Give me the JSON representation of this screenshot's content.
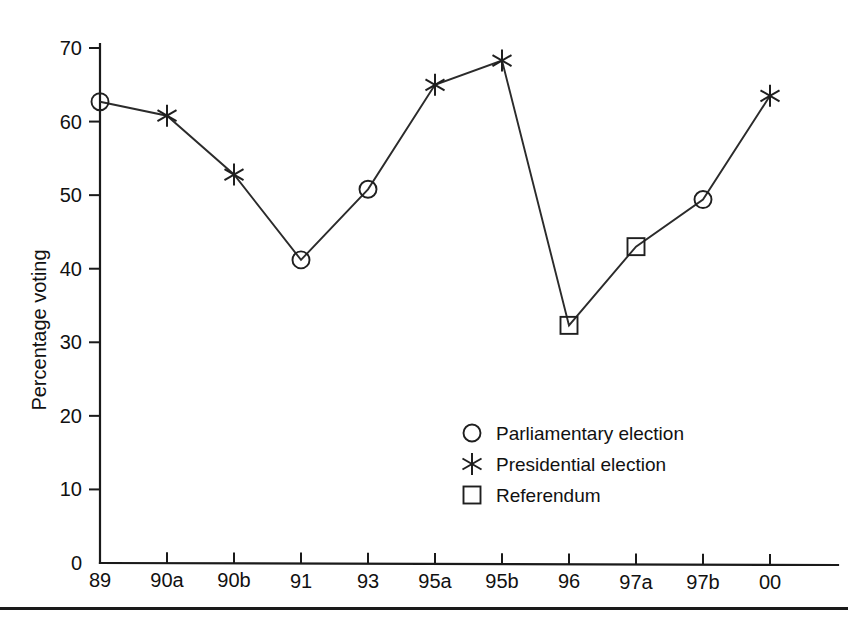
{
  "chart_data": {
    "type": "line",
    "title": "",
    "subtitle": "",
    "xlabel": "",
    "ylabel": "Percentage voting",
    "categories": [
      "89",
      "90a",
      "90b",
      "91",
      "93",
      "95a",
      "95b",
      "96",
      "97a",
      "97b",
      "00"
    ],
    "values": [
      62.7,
      60.8,
      52.8,
      41.2,
      50.8,
      65.0,
      68.3,
      32.3,
      43.0,
      49.4,
      63.5
    ],
    "marker_types": [
      "circle",
      "star",
      "star",
      "circle",
      "circle",
      "star",
      "star",
      "square",
      "square",
      "circle",
      "star"
    ],
    "series": [
      {
        "name": "Percentage voting",
        "values": [
          62.7,
          60.8,
          52.8,
          41.2,
          50.8,
          65.0,
          68.3,
          32.3,
          43.0,
          49.4,
          63.5
        ]
      }
    ],
    "ylim": [
      0,
      70
    ],
    "yticks": [
      0,
      10,
      20,
      30,
      40,
      50,
      60,
      70
    ],
    "ytick_labels": [
      "0",
      "10",
      "20",
      "30",
      "40",
      "50",
      "60",
      "70"
    ],
    "xtick_labels": [
      "89",
      "90a",
      "90b",
      "91",
      "93",
      "95a",
      "95b",
      "96",
      "97a",
      "97b",
      "00"
    ],
    "grid": false,
    "legend_position": "center-right-inside",
    "legend": [
      {
        "marker": "circle",
        "label": "Parliamentary election"
      },
      {
        "marker": "star",
        "label": "Presidential election"
      },
      {
        "marker": "square",
        "label": "Referendum"
      }
    ],
    "colors": {
      "line": "#2b2b2b",
      "marker": "#1f1f1f",
      "axis": "#1a1a1a",
      "text": "#111111",
      "background": "#ffffff"
    }
  }
}
